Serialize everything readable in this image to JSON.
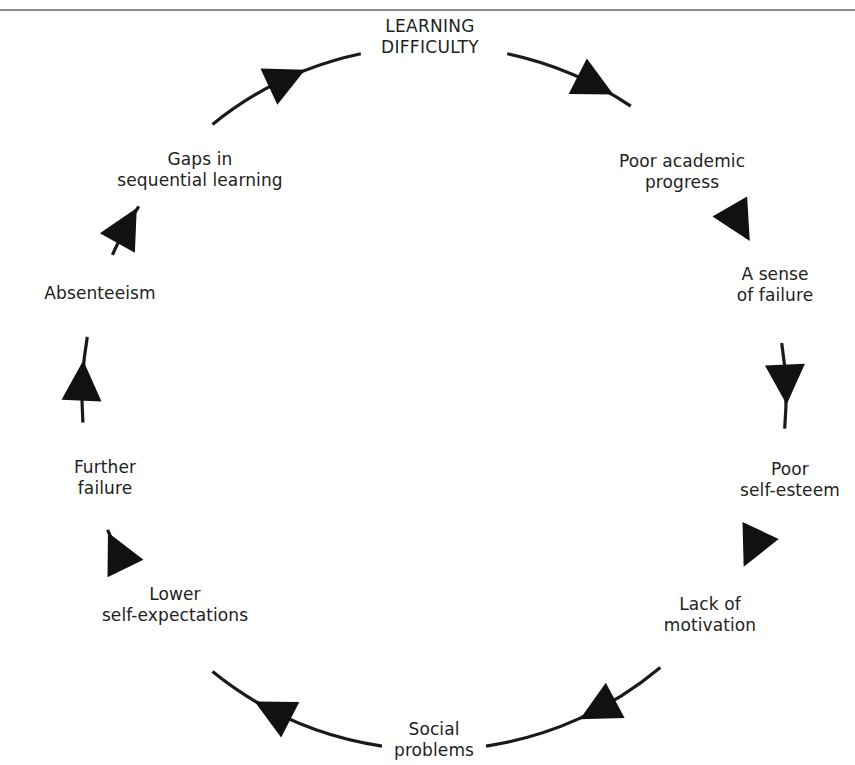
{
  "diagram": {
    "type": "cycle",
    "direction": "clockwise",
    "center": [
      434,
      398
    ],
    "radius": 352,
    "stroke_color": "#1a1a1a",
    "arrow_color": "#111111",
    "nodes": [
      {
        "id": "learning-difficulty",
        "lines": [
          "LEARNING",
          "DIFFICULTY"
        ],
        "x": 430,
        "y": 37,
        "angle": -90,
        "gap": 12
      },
      {
        "id": "poor-academic-progress",
        "lines": [
          "Poor academic",
          "progress"
        ],
        "x": 682,
        "y": 172,
        "angle": -43,
        "gap": 13
      },
      {
        "id": "sense-of-failure",
        "lines": [
          "A sense",
          "of failure"
        ],
        "x": 775,
        "y": 285,
        "angle": -18,
        "gap": 9
      },
      {
        "id": "poor-self-esteem",
        "lines": [
          "Poor",
          "self-esteem"
        ],
        "x": 790,
        "y": 480,
        "angle": 14,
        "gap": 9
      },
      {
        "id": "lack-of-motivation",
        "lines": [
          "Lack of",
          "motivation"
        ],
        "x": 710,
        "y": 615,
        "angle": 39,
        "gap": 11
      },
      {
        "id": "social-problems",
        "lines": [
          "Social",
          "problems"
        ],
        "x": 434,
        "y": 740,
        "angle": 90,
        "gap": 8.5
      },
      {
        "id": "lower-self-expectations",
        "lines": [
          "Lower",
          "self-expectations"
        ],
        "x": 175,
        "y": 605,
        "angle": 141,
        "gap": 12
      },
      {
        "id": "further-failure",
        "lines": [
          "Further",
          "failure"
        ],
        "x": 105,
        "y": 478,
        "angle": 167,
        "gap": 9
      },
      {
        "id": "absenteeism",
        "lines": [
          "Absenteeism"
        ],
        "x": 100,
        "y": 293,
        "angle": 197,
        "gap": 7
      },
      {
        "id": "gaps-in-sequential-learning",
        "lines": [
          "Gaps in",
          "sequential learning"
        ],
        "x": 200,
        "y": 170,
        "angle": 222,
        "gap": 9
      }
    ],
    "arrows": [
      {
        "between": [
          "learning-difficulty",
          "poor-academic-progress"
        ],
        "angle": -63
      },
      {
        "between": [
          "poor-academic-progress",
          "sense-of-failure"
        ],
        "angle": -30
      },
      {
        "between": [
          "sense-of-failure",
          "poor-self-esteem"
        ],
        "angle": -2.5
      },
      {
        "between": [
          "poor-self-esteem",
          "lack-of-motivation"
        ],
        "angle": 25
      },
      {
        "between": [
          "lack-of-motivation",
          "social-problems"
        ],
        "angle": 62
      },
      {
        "between": [
          "social-problems",
          "lower-self-expectations"
        ],
        "angle": 117
      },
      {
        "between": [
          "lower-self-expectations",
          "further-failure"
        ],
        "angle": 154
      },
      {
        "between": [
          "further-failure",
          "absenteeism"
        ],
        "angle": 182.5
      },
      {
        "between": [
          "absenteeism",
          "gaps-in-sequential-learning"
        ],
        "angle": 209
      },
      {
        "between": [
          "gaps-in-sequential-learning",
          "learning-difficulty"
        ],
        "angle": 245
      }
    ]
  }
}
